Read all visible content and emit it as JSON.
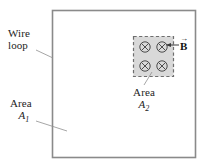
{
  "figure": {
    "type": "physics-diagram",
    "background_color": "#ffffff",
    "loop": {
      "label_line1": "Wire",
      "label_line2": "loop",
      "border_color": "#808080",
      "x": 52,
      "y": 10,
      "width": 144,
      "height": 148
    },
    "area1": {
      "label_line1": "Area",
      "symbol": "A",
      "subscript": "1"
    },
    "area2": {
      "label_line1": "Area",
      "symbol": "A",
      "subscript": "2",
      "fill_color": "#d8d8d8",
      "dash_color": "#6e6e6e",
      "x": 133,
      "y": 36,
      "width": 41,
      "height": 41
    },
    "field": {
      "symbol": "B",
      "vector_arrow": "→",
      "direction": "into-page",
      "marker_glyph": "⊗",
      "marker_count": 4,
      "marker_color": "#555555"
    }
  }
}
